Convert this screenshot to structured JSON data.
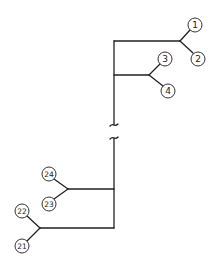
{
  "diagram": {
    "type": "tree",
    "trunk": {
      "x": 114,
      "y_top": 41,
      "y_break_top": 125,
      "y_break_bottom": 138,
      "y_bottom": 228
    },
    "branches": [
      {
        "id": "b1",
        "y": 41,
        "x_end": 180,
        "children": [
          "1",
          "2"
        ]
      },
      {
        "id": "b2",
        "y": 75,
        "x_end": 149,
        "children": [
          "3",
          "4"
        ]
      },
      {
        "id": "b3",
        "y": 189,
        "x_end": 68,
        "children": [
          "24",
          "23"
        ]
      },
      {
        "id": "b4",
        "y": 228,
        "x_end": 40,
        "children": [
          "22",
          "21"
        ]
      }
    ],
    "nodes": [
      {
        "label": "1",
        "cx": 195,
        "cy": 25,
        "jx": 180,
        "jy": 41
      },
      {
        "label": "2",
        "cx": 198,
        "cy": 59,
        "jx": 180,
        "jy": 41
      },
      {
        "label": "3",
        "cx": 165,
        "cy": 59,
        "jx": 149,
        "jy": 75
      },
      {
        "label": "4",
        "cx": 168,
        "cy": 91,
        "jx": 149,
        "jy": 75
      },
      {
        "label": "24",
        "cx": 49,
        "cy": 174,
        "jx": 68,
        "jy": 189
      },
      {
        "label": "23",
        "cx": 49,
        "cy": 204,
        "jx": 68,
        "jy": 189
      },
      {
        "label": "22",
        "cx": 22,
        "cy": 211,
        "jx": 40,
        "jy": 228
      },
      {
        "label": "21",
        "cx": 22,
        "cy": 246,
        "jx": 40,
        "jy": 228
      }
    ],
    "break_symbol": "wavy-break"
  }
}
